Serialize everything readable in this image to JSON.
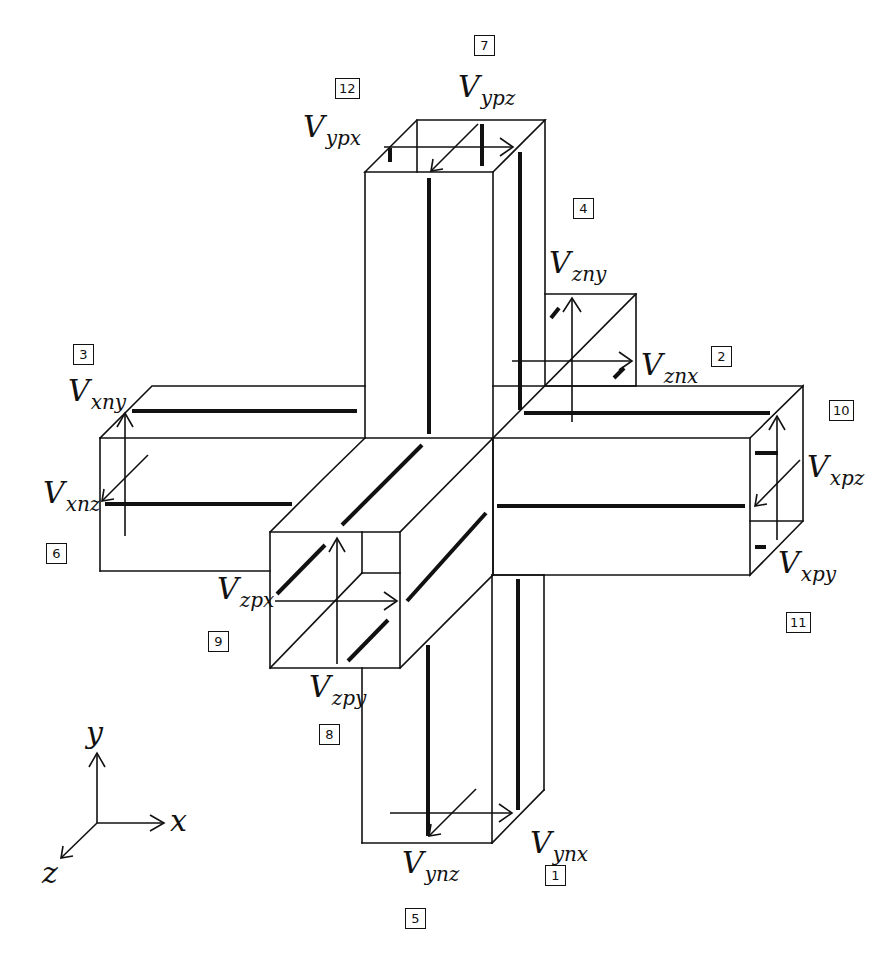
{
  "diagram": {
    "labels": [
      {
        "id": "vypx",
        "main": "V",
        "sub": "ypx",
        "x": 303,
        "y": 118
      },
      {
        "id": "vypz",
        "main": "V",
        "sub": "ypz",
        "x": 458,
        "y": 78
      },
      {
        "id": "vzny",
        "main": "V",
        "sub": "zny",
        "x": 549,
        "y": 252
      },
      {
        "id": "vznx",
        "main": "V",
        "sub": "znx",
        "x": 641,
        "y": 357
      },
      {
        "id": "vxny",
        "main": "V",
        "sub": "xny",
        "x": 68,
        "y": 382
      },
      {
        "id": "vxnz",
        "main": "V",
        "sub": "xnz",
        "x": 43,
        "y": 485
      },
      {
        "id": "vxpz",
        "main": "V",
        "sub": "xpz",
        "x": 807,
        "y": 460
      },
      {
        "id": "vxpy",
        "main": "V",
        "sub": "xpy",
        "x": 778,
        "y": 555
      },
      {
        "id": "vzpx",
        "main": "V",
        "sub": "zpx",
        "x": 217,
        "y": 580
      },
      {
        "id": "vzpy",
        "main": "V",
        "sub": "zpy",
        "x": 309,
        "y": 677
      },
      {
        "id": "vynx",
        "main": "V",
        "sub": "ynx",
        "x": 530,
        "y": 835
      },
      {
        "id": "vynz",
        "main": "V",
        "sub": "ynz",
        "x": 402,
        "y": 850
      }
    ],
    "port_numbers": [
      {
        "n": "1",
        "x": 545,
        "y": 865
      },
      {
        "n": "2",
        "x": 711,
        "y": 346
      },
      {
        "n": "3",
        "x": 73,
        "y": 344
      },
      {
        "n": "4",
        "x": 573,
        "y": 198
      },
      {
        "n": "5",
        "x": 405,
        "y": 908
      },
      {
        "n": "6",
        "x": 46,
        "y": 543
      },
      {
        "n": "7",
        "x": 474,
        "y": 35
      },
      {
        "n": "8",
        "x": 319,
        "y": 724
      },
      {
        "n": "9",
        "x": 208,
        "y": 631
      },
      {
        "n": "10",
        "x": 829,
        "y": 400
      },
      {
        "n": "11",
        "x": 786,
        "y": 612
      },
      {
        "n": "12",
        "x": 335,
        "y": 78
      }
    ],
    "axes": {
      "x_label": "x",
      "y_label": "y",
      "z_label": "z"
    }
  }
}
